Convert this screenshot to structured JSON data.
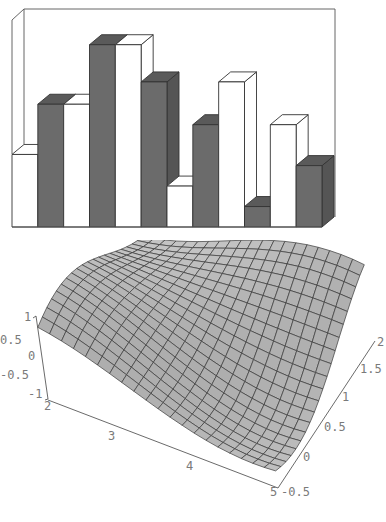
{
  "chart_data": [
    {
      "type": "bar",
      "variant": "3d-grouped",
      "title": "",
      "xlabel": "",
      "ylabel": "",
      "grid": false,
      "legend": null,
      "axis_ticks_shown": false,
      "categories": [
        "1",
        "2",
        "3",
        "4",
        "5",
        "6",
        "7",
        "8",
        "9",
        "10",
        "11",
        "12"
      ],
      "series_colors": {
        "light": "#ffffff",
        "dark": "#6b6b6b"
      },
      "bars": [
        {
          "shade": "light",
          "height": 0.39
        },
        {
          "shade": "dark",
          "height": 0.66
        },
        {
          "shade": "light",
          "height": 0.66
        },
        {
          "shade": "dark",
          "height": 0.98
        },
        {
          "shade": "light",
          "height": 0.98
        },
        {
          "shade": "dark",
          "height": 0.78
        },
        {
          "shade": "light",
          "height": 0.22
        },
        {
          "shade": "dark",
          "height": 0.55
        },
        {
          "shade": "light",
          "height": 0.78
        },
        {
          "shade": "dark",
          "height": 0.11
        },
        {
          "shade": "light",
          "height": 0.55
        },
        {
          "shade": "dark",
          "height": 0.33
        }
      ],
      "ylim": [
        0,
        1
      ]
    },
    {
      "type": "surface",
      "title": "",
      "x_axis": {
        "range": [
          2,
          5
        ],
        "ticks": [
          "2",
          "3",
          "4",
          "5"
        ]
      },
      "y_axis": {
        "range": [
          -0.5,
          2
        ],
        "ticks": [
          "-0.5",
          "0",
          "0.5",
          "1",
          "1.5",
          "2"
        ]
      },
      "z_axis": {
        "range": [
          -1,
          1
        ],
        "ticks": [
          "1",
          "0.5",
          "0",
          "-0.5",
          "-1"
        ]
      },
      "mesh": "20x20 grid",
      "shading": "gray",
      "grid": false
    }
  ],
  "labels": {
    "z_ticks": [
      "1",
      "0.5",
      "0",
      "-0.5",
      "-1"
    ],
    "x_ticks": [
      "2",
      "3",
      "4",
      "5"
    ],
    "y_ticks": [
      "-0.5",
      "0",
      "0.5",
      "1",
      "1.5",
      "2"
    ]
  }
}
